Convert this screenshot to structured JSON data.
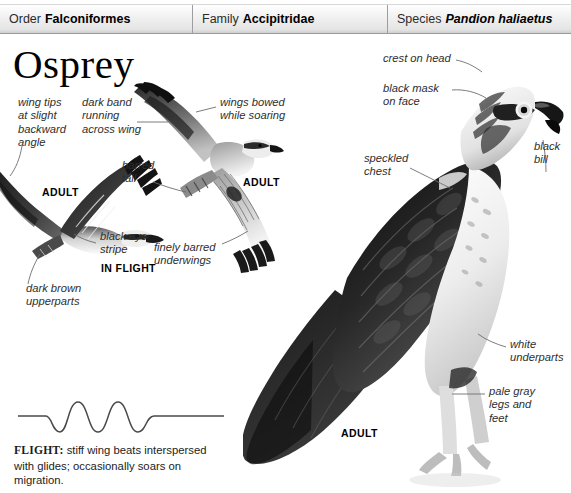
{
  "header": {
    "cells": [
      {
        "rank": "Order",
        "name": "Falconiformes",
        "italic": false
      },
      {
        "rank": "Family",
        "name": "Accipitridae",
        "italic": false
      },
      {
        "rank": "Species",
        "name": "Pandion haliaetus",
        "italic": true
      }
    ]
  },
  "title": "Osprey",
  "annotations": {
    "wing_tips": "wing tips\nat slight\nbackward\nangle",
    "dark_band": "dark band\nrunning\nacross wing",
    "wings_bowed": "wings bowed\nwhile soaring",
    "barred_tail": "barred\ntail",
    "black_eye_stripe": "black eye\nstripe",
    "finely_barred": "finely barred\nunderwings",
    "dark_brown": "dark brown\nupperparts",
    "crest_on_head": "crest on head",
    "black_mask": "black mask\non face",
    "speckled_chest": "speckled\nchest",
    "black_bill": "black\nbill",
    "white_underparts": "white\nunderparts",
    "pale_gray_legs": "pale gray\nlegs and\nfeet"
  },
  "captions": {
    "adult_flying": "ADULT",
    "adult_soaring": "ADULT",
    "in_flight": "IN FLIGHT",
    "adult_perched": "ADULT"
  },
  "flight": {
    "label": "FLIGHT:",
    "description": " stiff wing beats interspersed with glides; occasionally soars on migration."
  },
  "colors": {
    "page_background": "#ffffff",
    "header_background": "#e4e4e4",
    "header_border": "#9a9a9a",
    "text": "#1a1a1a",
    "annotation_text": "#2e2e2e",
    "leader_line": "#6d6d6d",
    "wave_stroke": "#4a4a4a",
    "plumage_dark": "#2a2a2a",
    "plumage_mid": "#7d7d7d",
    "plumage_light": "#d8d8d8"
  }
}
